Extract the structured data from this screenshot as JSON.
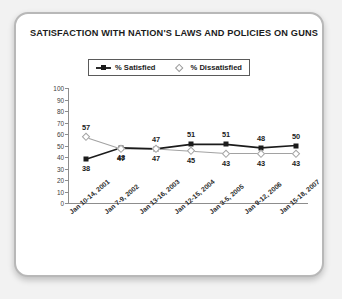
{
  "chart_data": {
    "type": "line",
    "title": "SATISFACTION WITH NATION'S LAWS AND POLICIES ON GUNS",
    "xlabel": "",
    "ylabel": "",
    "ylim": [
      0,
      100
    ],
    "yticks": [
      0,
      10,
      20,
      30,
      40,
      50,
      60,
      70,
      80,
      90,
      100
    ],
    "grid": false,
    "legend_position": "top-center",
    "categories": [
      "Jan 10-14, 2001",
      "Jan 7-9, 2002",
      "Jan 13-16, 2003",
      "Jan 12-15, 2004",
      "Jan 3-5, 2005",
      "Jan 9-12, 2006",
      "Jan 15-18, 2007"
    ],
    "series": [
      {
        "name": "% Satisfied",
        "marker": "filled-square",
        "color": "#1b1b1b",
        "values": [
          38,
          48,
          47,
          51,
          51,
          48,
          50
        ],
        "label_position": [
          "below",
          "below",
          "below",
          "above",
          "above",
          "above",
          "above"
        ]
      },
      {
        "name": "% Dissatisfied",
        "marker": "open-diamond",
        "color": "#a2a2a2",
        "values": [
          57,
          47,
          47,
          45,
          43,
          43,
          43
        ],
        "label_position": [
          "above",
          "below",
          "above",
          "below",
          "below",
          "below",
          "below"
        ]
      }
    ]
  },
  "card": {
    "title": "SATISFACTION WITH NATION'S LAWS AND POLICIES ON GUNS"
  },
  "legend": {
    "items": [
      {
        "label": "% Satisfied",
        "icon": "filled-square-line-marker"
      },
      {
        "label": "% Dissatisfied",
        "icon": "open-diamond-marker"
      }
    ]
  }
}
